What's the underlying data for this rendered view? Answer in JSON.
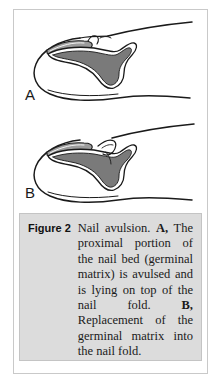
{
  "figure": {
    "label": "Figure 2",
    "caption": {
      "lead": "Nail avulsion. ",
      "part_a_label": "A,",
      "part_a_text": " The proximal portion of the nail bed (germinal matrix) is avulsed and is lying on top of the nail fold. ",
      "part_b_label": "B,",
      "part_b_text": " Replacement of the germinal matrix into the nail fold.",
      "full_text": "Nail avulsion. A, The proximal portion of the nail bed (germinal matrix) is avulsed and is lying on top of the nail fold. B, Replacement of the germinal matrix into the nail fold."
    },
    "panels": [
      {
        "letter": "A",
        "description": "Line drawing of a fingertip in lateral view; the proximal nail plate is lifted out of the nail fold and lies on top of it, exposing the shaded germinal matrix of the nail bed."
      },
      {
        "letter": "B",
        "description": "Line drawing of the same fingertip with the germinal matrix replaced back underneath the proximal nail fold."
      }
    ],
    "colors": {
      "nail_bed_fill": "#7a7a7a",
      "outline": "#1a1a1a",
      "caption_background": "#dcdcdc",
      "panel_border": "#c9c9c9",
      "page_background": "#ffffff"
    }
  }
}
